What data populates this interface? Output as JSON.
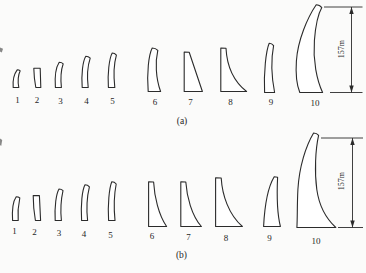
{
  "figure": {
    "background": "#fbfbfa",
    "stroke_color": "#2b2b2b",
    "rows": [
      {
        "id": "a",
        "caption": "(a)",
        "caption_pos": {
          "x": 182,
          "y": 124
        },
        "dimension": {
          "label": "157m",
          "line": {
            "x": 351.5,
            "y1": 7,
            "y2": 92.5
          },
          "ext_top": {
            "x1": 324,
            "x2": 362.5,
            "y": 7
          },
          "ext_bottom": {
            "x1": 330,
            "x2": 362.5,
            "y": 92.5
          },
          "label_pos": {
            "x": 341.5,
            "y": 49
          }
        },
        "shapes": [
          {
            "label": "1",
            "label_pos": {
              "x": 17.5,
              "y": 103
            },
            "path": "M 17.2,69.8 C 14.4,73.5 12.6,80.5 13.2,87.5 L 18.8,87.5 C 17.6,81 18.4,74.5 20.2,70.8 C 19.2,69.9 18.2,69.8 17.2,69.8 Z"
          },
          {
            "label": "2",
            "label_pos": {
              "x": 37,
              "y": 103
            },
            "path": "M 33.8,68.2 L 40.2,68.2 L 40.8,87.5 L 35.8,87.5 C 34.6,81 33.9,74 33.8,68.2 Z"
          },
          {
            "label": "3",
            "label_pos": {
              "x": 60.5,
              "y": 103.5
            },
            "path": "M 59.2,62.2 C 56.4,66.5 54.6,76.5 55.4,87.5 L 61.4,87.5 C 60.4,78 61.2,69.5 63.2,63.8 C 61.8,62.3 60.4,62.2 59.2,62.2 Z"
          },
          {
            "label": "4",
            "label_pos": {
              "x": 86.5,
              "y": 104
            },
            "path": "M 85.8,56.2 C 82.8,61 81.2,74 82.2,87.5 L 88.2,87.5 C 86.8,76 87.6,66 90.2,58.2 C 88.6,56.4 87.2,56.2 85.8,56.2 Z"
          },
          {
            "label": "5",
            "label_pos": {
              "x": 112.5,
              "y": 104
            },
            "path": "M 112.2,53 C 109.2,58.5 107.4,74 108.4,87.5 L 114.8,87.5 C 113.4,75 114,63.5 116.4,55.2 C 114.9,53.3 113.5,53 112.2,53 Z"
          },
          {
            "label": "6",
            "label_pos": {
              "x": 155,
              "y": 104.5
            },
            "path": "M 152.2,48 C 148.8,54.5 146.6,73 148.2,91.5 L 160.6,91.5 C 155.6,78 155.2,61.5 157.8,50.4 C 155.9,48.3 154,48 152.2,48 Z"
          },
          {
            "label": "7",
            "label_pos": {
              "x": 190.5,
              "y": 105
            },
            "path": "M 184.2,52 L 189.2,52.2 L 202.4,91.5 L 184.2,91.5 Z"
          },
          {
            "label": "8",
            "label_pos": {
              "x": 230.5,
              "y": 105
            },
            "path": "M 220.8,48 L 226,48.2 C 226.8,63.5 232.6,80.5 246.6,91.5 L 220.8,91.5 Z"
          },
          {
            "label": "9",
            "label_pos": {
              "x": 271,
              "y": 104.5
            },
            "path": "M 269.2,43.2 C 266,50.5 263.6,73 264.6,92.5 L 274.6,92.5 C 271.4,76 271.2,58 273.6,45.6 C 272.1,43.5 270.6,43.2 269.2,43.2 Z"
          },
          {
            "label": "10",
            "label_pos": {
              "x": 315,
              "y": 105.5
            },
            "path": "M 316.2,4.8 C 307.6,17.5 297.8,40 296.4,61 C 295.4,75.5 297.2,86 299.8,92.5 L 322.6,92.5 C 316.8,80 312.8,60.5 314.4,40.5 C 315.5,26.5 318.8,12.8 321.8,7.6 C 320,5.2 318,4.8 316.2,4.8 Z"
          }
        ]
      },
      {
        "id": "b",
        "caption": "(b)",
        "caption_pos": {
          "x": 181.5,
          "y": 258
        },
        "dimension": {
          "label": "157m",
          "line": {
            "x": 352.5,
            "y1": 138,
            "y2": 227.5
          },
          "ext_top": {
            "x1": 321,
            "x2": 363,
            "y": 138
          },
          "ext_bottom": {
            "x1": 338,
            "x2": 363,
            "y": 227.5
          },
          "label_pos": {
            "x": 341.5,
            "y": 181
          }
        },
        "shapes": [
          {
            "label": "1",
            "label_pos": {
              "x": 14.5,
              "y": 234
            },
            "path": "M 16.2,196.8 C 13.6,200.5 11.9,209.5 12.6,220.5 L 18.2,220.5 C 17.6,213 18.2,205.5 19.8,198 C 18.6,196.9 17.4,196.8 16.2,196.8 Z"
          },
          {
            "label": "2",
            "label_pos": {
              "x": 34.5,
              "y": 234.5
            },
            "path": "M 33.2,195.6 L 39.4,195.6 L 40.6,220.5 L 35.4,220.5 C 34,212.5 33.2,203.5 33.2,195.6 Z"
          },
          {
            "label": "3",
            "label_pos": {
              "x": 59,
              "y": 235.5
            },
            "path": "M 59,189 C 56.2,193.8 54.4,206.5 55.2,220.5 L 61.4,220.5 C 60.2,209 61,199.5 63,190.6 C 61.6,189.1 60.2,189 59,189 Z"
          },
          {
            "label": "4",
            "label_pos": {
              "x": 84,
              "y": 236.5
            },
            "path": "M 85,184.8 C 82.2,190 80.6,204.5 81.6,220.5 L 87.6,220.5 C 86.2,207.5 87,196.5 89.4,186.8 C 87.9,185 86.4,184.8 85,184.8 Z"
          },
          {
            "label": "5",
            "label_pos": {
              "x": 110.5,
              "y": 238
            },
            "path": "M 111.8,181.8 C 109.2,188 107.6,205 108.6,220.5 L 115,220.5 C 113.6,206.5 114.2,194 116.2,184 C 114.7,182.1 113.2,181.8 111.8,181.8 Z"
          },
          {
            "label": "6",
            "label_pos": {
              "x": 152,
              "y": 239
            },
            "path": "M 148.6,181.8 L 153.6,182 C 154.4,196.5 158.6,215 166.6,226.5 L 148.6,226.5 Z"
          },
          {
            "label": "7",
            "label_pos": {
              "x": 188.5,
              "y": 240
            },
            "path": "M 180.8,181.8 L 185.8,182 C 186.8,196.5 191.6,215.5 201.4,226.5 L 180.8,226.5 Z"
          },
          {
            "label": "8",
            "label_pos": {
              "x": 226,
              "y": 241
            },
            "path": "M 215.6,177.8 L 221.2,178 C 222.2,195 228.6,214.5 242.4,226.5 L 215.6,226.5 Z"
          },
          {
            "label": "9",
            "label_pos": {
              "x": 269.5,
              "y": 240.5
            },
            "path": "M 274.2,176.8 L 277.6,177.2 C 276.9,192 276.5,211 280.4,226.5 L 263.6,226.5 C 264.6,206.5 267.8,187.5 274.2,176.8 Z"
          },
          {
            "label": "10",
            "label_pos": {
              "x": 316,
              "y": 243.5
            },
            "path": "M 313.6,133 C 305.8,146 299.2,167 297.9,189.5 C 297.1,204.5 297.5,217.5 296.9,227.5 L 335.8,227.5 C 326.6,219 319.2,206.5 316.8,189.5 C 314.4,172 315.4,149.5 318.6,135.4 C 317,133.3 315.3,133 313.6,133 Z"
          }
        ]
      }
    ],
    "artifacts": [
      {
        "path": "M 0,47.5 L 3,48.8 L 1.8,52.5 L 0,51.5 Z"
      },
      {
        "path": "M 0,138.5 L 2.2,140 L 1.2,146 L 0,145 Z"
      }
    ]
  }
}
